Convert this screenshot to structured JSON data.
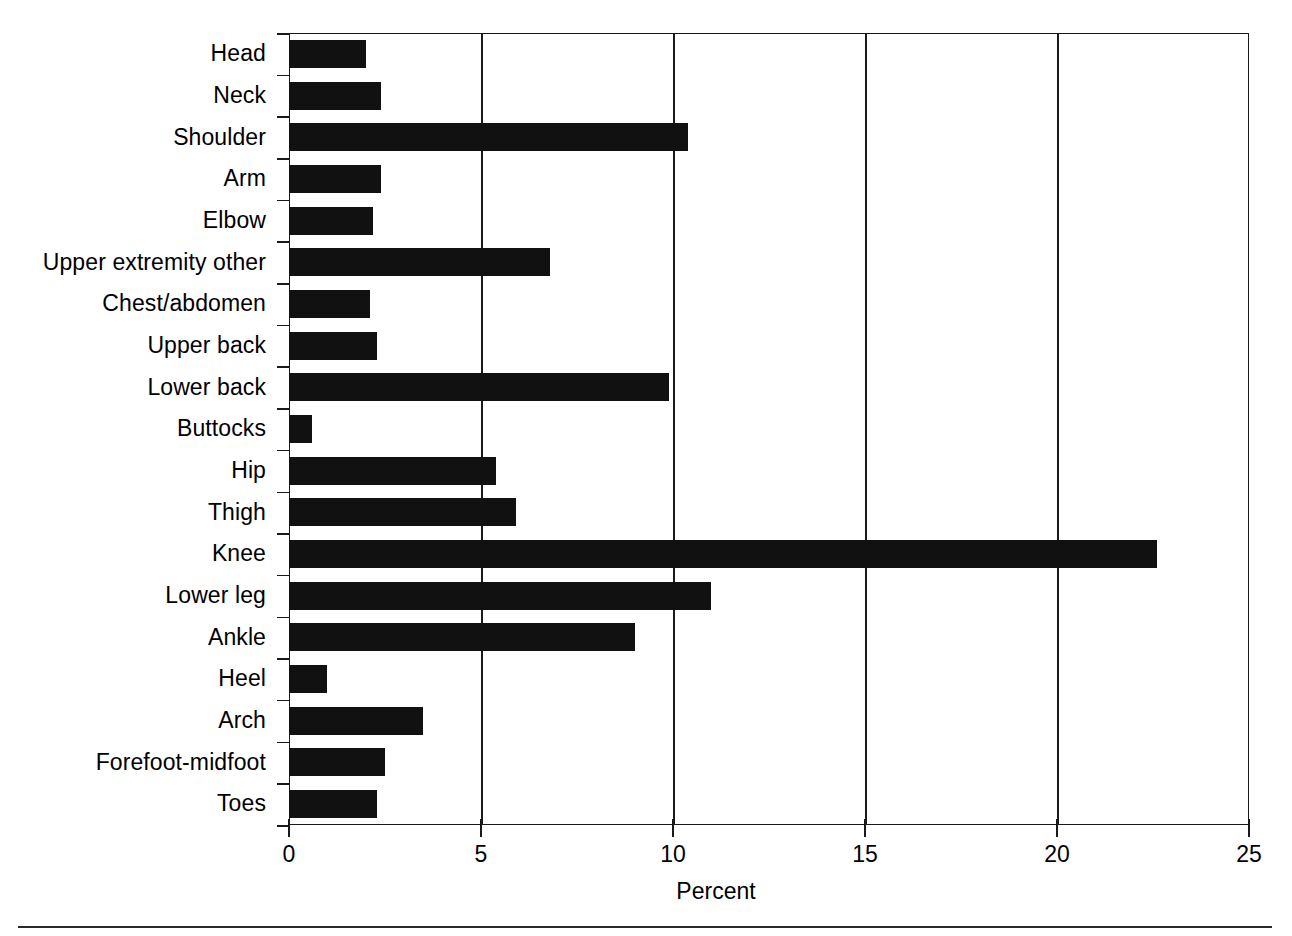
{
  "chart_data": {
    "type": "bar",
    "orientation": "horizontal",
    "title": "",
    "xlabel": "Percent",
    "ylabel": "",
    "xlim": [
      0,
      25
    ],
    "ylim": null,
    "grid": "vertical",
    "legend": null,
    "xticks": [
      0,
      5,
      10,
      15,
      20,
      25
    ],
    "xtick_labels": [
      "0",
      "5",
      "10",
      "15",
      "20",
      "25"
    ],
    "categories": [
      "Head",
      "Neck",
      "Shoulder",
      "Arm",
      "Elbow",
      "Upper extremity other",
      "Chest/abdomen",
      "Upper back",
      "Lower back",
      "Buttocks",
      "Hip",
      "Thigh",
      "Knee",
      "Lower leg",
      "Ankle",
      "Heel",
      "Arch",
      "Forefoot-midfoot",
      "Toes"
    ],
    "values": [
      2.0,
      2.4,
      10.4,
      2.4,
      2.2,
      6.8,
      2.1,
      2.3,
      9.9,
      0.6,
      5.4,
      5.9,
      22.6,
      11.0,
      9.0,
      1.0,
      3.5,
      2.5,
      2.3
    ],
    "series": [
      {
        "name": "Percent",
        "color": "#111111",
        "values": [
          2.0,
          2.4,
          10.4,
          2.4,
          2.2,
          6.8,
          2.1,
          2.3,
          9.9,
          0.6,
          5.4,
          5.9,
          22.6,
          11.0,
          9.0,
          1.0,
          3.5,
          2.5,
          2.3
        ]
      }
    ]
  },
  "axis": {
    "x_title": "Percent"
  }
}
